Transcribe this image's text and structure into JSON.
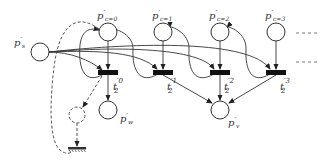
{
  "diagram": {
    "type": "petri-net",
    "places": [
      {
        "id": "ps",
        "label": "p",
        "prime": "′",
        "sub": "s",
        "x": 40,
        "y": 52,
        "lx": 14,
        "ly": 42
      },
      {
        "id": "pc0",
        "label": "p",
        "prime": "′",
        "sub": "c=0",
        "x": 108,
        "y": 32,
        "lx": 97,
        "ly": 17
      },
      {
        "id": "pc1",
        "label": "p",
        "prime": "′",
        "sub": "c=1",
        "x": 163,
        "y": 32,
        "lx": 152,
        "ly": 17
      },
      {
        "id": "pc2",
        "label": "p",
        "prime": "′",
        "sub": "c=2",
        "x": 220,
        "y": 32,
        "lx": 209,
        "ly": 17
      },
      {
        "id": "pc3",
        "label": "p",
        "prime": "′",
        "sub": "c=3",
        "x": 276,
        "y": 32,
        "lx": 265,
        "ly": 17
      },
      {
        "id": "pw",
        "label": "p",
        "prime": "′",
        "sub": "w",
        "x": 108,
        "y": 110,
        "lx": 120,
        "ly": 124
      },
      {
        "id": "pv",
        "label": "p",
        "prime": "′",
        "sub": "v",
        "x": 220,
        "y": 110,
        "lx": 228,
        "ly": 127
      }
    ],
    "transitions": [
      {
        "id": "t0",
        "label": "t",
        "sub": "2",
        "sup": "′0",
        "x": 108,
        "y": 72,
        "lx": 113,
        "ly": 90
      },
      {
        "id": "t1",
        "label": "t",
        "sub": "2",
        "sup": "′1",
        "x": 163,
        "y": 72,
        "lx": 167,
        "ly": 90
      },
      {
        "id": "t2",
        "label": "t",
        "sub": "2",
        "sup": "′2",
        "x": 220,
        "y": 72,
        "lx": 224,
        "ly": 90
      },
      {
        "id": "t3",
        "label": "t",
        "sub": "2",
        "sup": "′3",
        "x": 276,
        "y": 72,
        "lx": 280,
        "ly": 90
      }
    ],
    "continuation_marks": [
      "- - -",
      "- - -"
    ],
    "dashed_place": {
      "x": 77,
      "y": 115
    },
    "sink_symbol": {
      "x": 77,
      "y": 150
    }
  }
}
